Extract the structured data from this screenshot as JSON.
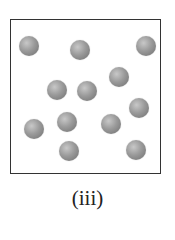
{
  "figure": {
    "label": "(iii)",
    "particles": [
      {
        "x": 29,
        "y": 46
      },
      {
        "x": 80,
        "y": 50
      },
      {
        "x": 146,
        "y": 46
      },
      {
        "x": 57,
        "y": 90
      },
      {
        "x": 87,
        "y": 91
      },
      {
        "x": 119,
        "y": 77
      },
      {
        "x": 139,
        "y": 108
      },
      {
        "x": 34,
        "y": 129
      },
      {
        "x": 67,
        "y": 122
      },
      {
        "x": 111,
        "y": 124
      },
      {
        "x": 69,
        "y": 151
      },
      {
        "x": 136,
        "y": 150
      }
    ],
    "particle_color": "#9a9a9a",
    "particle_count": 12
  }
}
